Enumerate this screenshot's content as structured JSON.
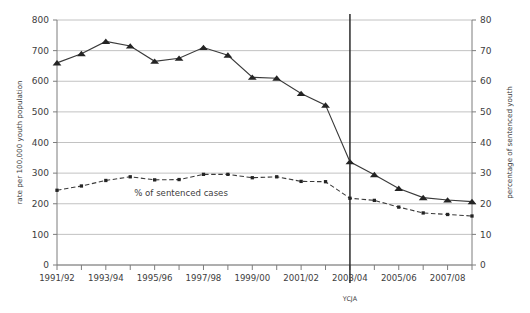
{
  "chart_data": {
    "type": "line",
    "title": "",
    "subtitle": "",
    "xlabel": "",
    "ylabel": "rate per 100,000 youth population",
    "y2label": "percentage of sentenced youth",
    "grid": true,
    "legend_position": "inline-annotation",
    "categories": [
      "1991/92",
      "1992/93",
      "1993/94",
      "1994/95",
      "1995/96",
      "1996/97",
      "1997/98",
      "1998/99",
      "1999/00",
      "2000/01",
      "2001/02",
      "2002/03",
      "2003/04",
      "2004/05",
      "2005/06",
      "2006/07",
      "2007/08",
      "2008/09"
    ],
    "xtick_labels_visible": [
      "1991/92",
      "",
      "1993/94",
      "",
      "1995/96",
      "",
      "1997/98",
      "",
      "1999/00",
      "",
      "2001/02",
      "",
      "2003/04",
      "",
      "2005/06",
      "",
      "2007/08",
      ""
    ],
    "ylim": [
      0,
      800
    ],
    "yticks": [
      0,
      100,
      200,
      300,
      400,
      500,
      600,
      700,
      800
    ],
    "ytick_labels": [
      "0",
      "100",
      "200",
      "300",
      "400",
      "500",
      "600",
      "700",
      "800"
    ],
    "y2lim": [
      0,
      80
    ],
    "y2ticks": [
      0,
      10,
      20,
      30,
      40,
      50,
      60,
      70,
      80
    ],
    "y2tick_labels": [
      "0",
      "10",
      "20",
      "30",
      "40",
      "50",
      "60",
      "70",
      "80"
    ],
    "series": [
      {
        "name": "custody rate per 100,000 youth population",
        "axis": "left",
        "marker": "triangle",
        "line_style": "solid",
        "color": "#242424",
        "values": [
          660,
          690,
          730,
          715,
          665,
          675,
          710,
          685,
          613,
          610,
          560,
          522,
          337,
          295,
          250,
          220,
          212,
          207
        ]
      },
      {
        "name": "% of sentenced cases",
        "axis": "left",
        "axis_equivalent_right": "percentage of sentenced youth",
        "marker": "square",
        "line_style": "dashed",
        "color": "#242424",
        "values": [
          244,
          258,
          276,
          288,
          278,
          279,
          296,
          296,
          285,
          288,
          273,
          272,
          218,
          211,
          189,
          170,
          165,
          160
        ],
        "values_as_percent": [
          24.4,
          25.8,
          27.6,
          28.8,
          27.8,
          27.9,
          29.6,
          29.6,
          28.5,
          28.8,
          27.3,
          27.2,
          21.8,
          21.1,
          18.9,
          17.0,
          16.5,
          16.0
        ]
      }
    ],
    "annotations": [
      {
        "name": "series-label-sentenced-cases",
        "text": "% of sentenced cases",
        "x_category": "1996/97",
        "y_value": 225
      },
      {
        "name": "event-marker-ycja",
        "text": "YCJA",
        "x_category": "2003/04",
        "type": "vertical-line"
      }
    ]
  },
  "axes": {
    "left_title": "rate per 100,000 youth population",
    "right_title": "percentage of sentenced youth"
  },
  "labels": {
    "series_annotation": "% of sentenced cases",
    "event_marker": "YCJA"
  },
  "colors": {
    "marker": "#242424",
    "line": "#3a3a3a",
    "grid": "#b2b2b2",
    "axis": "#7d7d7d",
    "text": "#3d3d3d",
    "event_line": "#2b2b2b",
    "background": "#ffffff"
  }
}
